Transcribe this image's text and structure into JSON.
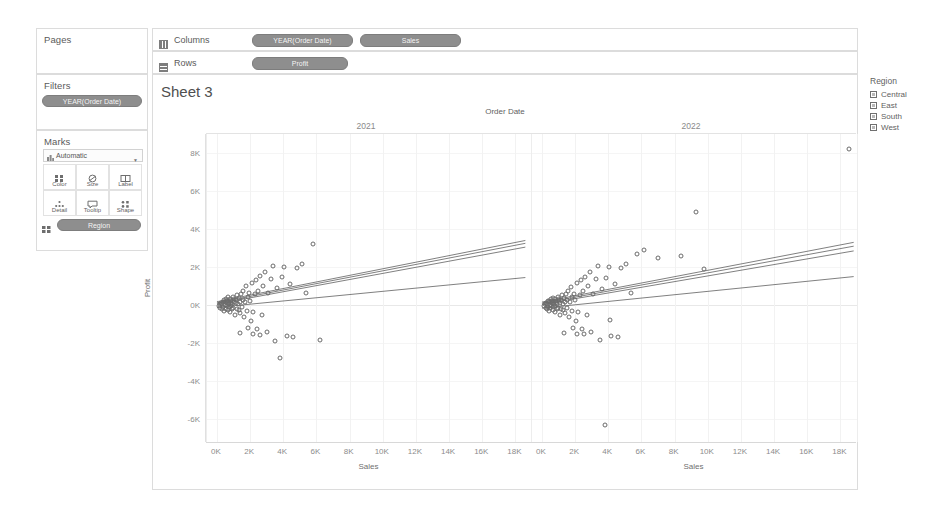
{
  "left_panel": {
    "pages": {
      "title": "Pages"
    },
    "filters": {
      "title": "Filters",
      "pills": [
        "YEAR(Order Date)"
      ]
    },
    "marks": {
      "title": "Marks",
      "type_selector": "Automatic",
      "buttons": [
        {
          "label": "Color",
          "icon": "color-squares-icon"
        },
        {
          "label": "Size",
          "icon": "size-circle-icon"
        },
        {
          "label": "Label",
          "icon": "label-box-icon"
        },
        {
          "label": "Detail",
          "icon": "detail-dots-icon"
        },
        {
          "label": "Tooltip",
          "icon": "tooltip-bubble-icon"
        },
        {
          "label": "Shape",
          "icon": "shape-icon"
        }
      ],
      "encoding_pills": [
        {
          "label": "Region",
          "icon": "color-squares-icon"
        }
      ]
    }
  },
  "shelves": {
    "columns": {
      "label": "Columns",
      "icon": "columns-icon",
      "pills": [
        "YEAR(Order Date)",
        "Sales"
      ]
    },
    "rows": {
      "label": "Rows",
      "icon": "rows-icon",
      "pills": [
        "Profit"
      ]
    }
  },
  "worksheet": {
    "title": "Sheet 3"
  },
  "legend": {
    "title": "Region",
    "items": [
      "Central",
      "East",
      "South",
      "West"
    ]
  },
  "chart_data": {
    "type": "scatter",
    "title": "Sheet 3",
    "column_field": "Order Date",
    "panels": [
      "2021",
      "2022"
    ],
    "xlabel": "Sales",
    "ylabel": "Profit",
    "xticks": [
      "0K",
      "2K",
      "4K",
      "6K",
      "8K",
      "10K",
      "12K",
      "14K",
      "16K",
      "18K"
    ],
    "yticks": [
      "8K",
      "6K",
      "4K",
      "2K",
      "0K",
      "-2K",
      "-4K",
      "-6K"
    ],
    "xlim": [
      -600,
      19000
    ],
    "ylim": [
      -7200,
      9000
    ],
    "grid": true,
    "legend_position": "right",
    "series_field": "Region",
    "series": [
      "Central",
      "East",
      "South",
      "West"
    ],
    "trend_lines": {
      "2021": [
        {
          "name": "Central",
          "x0": 0,
          "y0": 120,
          "x1": 18600,
          "y1": 3250
        },
        {
          "name": "East",
          "x0": 0,
          "y0": 60,
          "x1": 18600,
          "y1": 3050
        },
        {
          "name": "South",
          "x0": 0,
          "y0": 180,
          "x1": 18600,
          "y1": 3400
        },
        {
          "name": "West",
          "x0": 0,
          "y0": -120,
          "x1": 18600,
          "y1": 1450
        }
      ],
      "2022": [
        {
          "name": "Central",
          "x0": 0,
          "y0": 100,
          "x1": 18800,
          "y1": 3100
        },
        {
          "name": "East",
          "x0": 0,
          "y0": 40,
          "x1": 18800,
          "y1": 2850
        },
        {
          "name": "South",
          "x0": 0,
          "y0": 160,
          "x1": 18800,
          "y1": 3300
        },
        {
          "name": "West",
          "x0": 0,
          "y0": -160,
          "x1": 18800,
          "y1": 1500
        }
      ]
    },
    "points": {
      "2021": [
        [
          120,
          -60
        ],
        [
          180,
          40
        ],
        [
          210,
          -140
        ],
        [
          260,
          110
        ],
        [
          300,
          -220
        ],
        [
          330,
          60
        ],
        [
          360,
          180
        ],
        [
          390,
          -90
        ],
        [
          420,
          250
        ],
        [
          450,
          -310
        ],
        [
          470,
          20
        ],
        [
          500,
          140
        ],
        [
          520,
          -180
        ],
        [
          550,
          330
        ],
        [
          580,
          -60
        ],
        [
          600,
          90
        ],
        [
          630,
          210
        ],
        [
          650,
          -260
        ],
        [
          680,
          410
        ],
        [
          700,
          -120
        ],
        [
          720,
          60
        ],
        [
          750,
          170
        ],
        [
          770,
          -380
        ],
        [
          800,
          300
        ],
        [
          820,
          -40
        ],
        [
          850,
          120
        ],
        [
          870,
          240
        ],
        [
          900,
          -200
        ],
        [
          920,
          60
        ],
        [
          950,
          450
        ],
        [
          980,
          -140
        ],
        [
          1000,
          180
        ],
        [
          1050,
          330
        ],
        [
          1080,
          -520
        ],
        [
          1120,
          90
        ],
        [
          1150,
          260
        ],
        [
          1180,
          -180
        ],
        [
          1220,
          520
        ],
        [
          1250,
          40
        ],
        [
          1300,
          -260
        ],
        [
          1340,
          380
        ],
        [
          1380,
          160
        ],
        [
          1420,
          -420
        ],
        [
          1460,
          610
        ],
        [
          1500,
          -120
        ],
        [
          1550,
          290
        ],
        [
          1600,
          760
        ],
        [
          1650,
          -620
        ],
        [
          1700,
          170
        ],
        [
          1750,
          980
        ],
        [
          1800,
          -300
        ],
        [
          1850,
          430
        ],
        [
          1900,
          -1180
        ],
        [
          1950,
          620
        ],
        [
          2000,
          240
        ],
        [
          2050,
          -820
        ],
        [
          2120,
          1180
        ],
        [
          2200,
          -340
        ],
        [
          2280,
          560
        ],
        [
          2350,
          1320
        ],
        [
          2420,
          -1260
        ],
        [
          2500,
          760
        ],
        [
          2600,
          1520
        ],
        [
          2700,
          -520
        ],
        [
          2800,
          1010
        ],
        [
          2900,
          1760
        ],
        [
          3000,
          -1420
        ],
        [
          3100,
          620
        ],
        [
          3250,
          1380
        ],
        [
          3400,
          2080
        ],
        [
          3500,
          -1880
        ],
        [
          3650,
          880
        ],
        [
          3800,
          -2800
        ],
        [
          3900,
          1460
        ],
        [
          4050,
          2020
        ],
        [
          4200,
          -1620
        ],
        [
          4400,
          1120
        ],
        [
          4600,
          -1700
        ],
        [
          4800,
          1950
        ],
        [
          5100,
          2180
        ],
        [
          5400,
          640
        ],
        [
          5800,
          3220
        ],
        [
          6200,
          -1820
        ],
        [
          1400,
          -1460
        ],
        [
          2150,
          -1520
        ],
        [
          2600,
          -1560
        ]
      ],
      "2022": [
        [
          110,
          -70
        ],
        [
          170,
          50
        ],
        [
          220,
          -130
        ],
        [
          250,
          120
        ],
        [
          290,
          -200
        ],
        [
          320,
          70
        ],
        [
          350,
          190
        ],
        [
          380,
          -100
        ],
        [
          410,
          240
        ],
        [
          440,
          -290
        ],
        [
          460,
          30
        ],
        [
          490,
          150
        ],
        [
          510,
          -170
        ],
        [
          540,
          320
        ],
        [
          570,
          -70
        ],
        [
          590,
          100
        ],
        [
          620,
          200
        ],
        [
          640,
          -250
        ],
        [
          670,
          400
        ],
        [
          690,
          -110
        ],
        [
          710,
          70
        ],
        [
          740,
          160
        ],
        [
          760,
          -360
        ],
        [
          790,
          310
        ],
        [
          810,
          -50
        ],
        [
          840,
          130
        ],
        [
          860,
          230
        ],
        [
          890,
          -210
        ],
        [
          910,
          50
        ],
        [
          940,
          440
        ],
        [
          970,
          -150
        ],
        [
          1000,
          190
        ],
        [
          1040,
          340
        ],
        [
          1070,
          -500
        ],
        [
          1110,
          100
        ],
        [
          1140,
          250
        ],
        [
          1170,
          -190
        ],
        [
          1210,
          510
        ],
        [
          1240,
          50
        ],
        [
          1290,
          -250
        ],
        [
          1330,
          370
        ],
        [
          1370,
          170
        ],
        [
          1410,
          -410
        ],
        [
          1450,
          600
        ],
        [
          1490,
          -130
        ],
        [
          1540,
          280
        ],
        [
          1590,
          750
        ],
        [
          1640,
          -610
        ],
        [
          1690,
          180
        ],
        [
          1740,
          960
        ],
        [
          1790,
          -310
        ],
        [
          1840,
          420
        ],
        [
          1890,
          -1200
        ],
        [
          1940,
          610
        ],
        [
          1990,
          250
        ],
        [
          2040,
          -810
        ],
        [
          2110,
          1160
        ],
        [
          2190,
          -350
        ],
        [
          2270,
          550
        ],
        [
          2340,
          1300
        ],
        [
          2410,
          -1240
        ],
        [
          2490,
          740
        ],
        [
          2590,
          1500
        ],
        [
          2690,
          -530
        ],
        [
          2790,
          1000
        ],
        [
          2890,
          1740
        ],
        [
          2980,
          -1400
        ],
        [
          3090,
          600
        ],
        [
          3240,
          1360
        ],
        [
          3390,
          2060
        ],
        [
          3490,
          -1860
        ],
        [
          3640,
          860
        ],
        [
          3780,
          -6300
        ],
        [
          3880,
          1440
        ],
        [
          4030,
          2000
        ],
        [
          4180,
          -1640
        ],
        [
          4380,
          1100
        ],
        [
          4580,
          -1690
        ],
        [
          4780,
          1930
        ],
        [
          5080,
          2160
        ],
        [
          5380,
          620
        ],
        [
          5750,
          2700
        ],
        [
          6150,
          2900
        ],
        [
          7000,
          2500
        ],
        [
          8400,
          2580
        ],
        [
          9300,
          4900
        ],
        [
          9800,
          1900
        ],
        [
          18500,
          8200
        ],
        [
          1350,
          -1450
        ],
        [
          2100,
          -1500
        ],
        [
          2550,
          -1540
        ],
        [
          4100,
          -760
        ]
      ]
    }
  }
}
